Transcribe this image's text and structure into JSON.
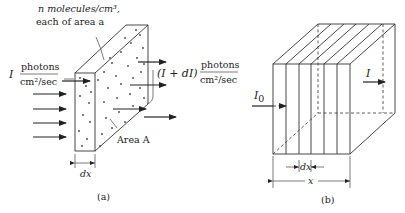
{
  "panel_a": {
    "annotation_line1": "n molecules/cm³,",
    "annotation_line2": "each of area a",
    "incident_symbol": "I",
    "incident_unit_num": "photons",
    "incident_unit_den": "cm²/sec",
    "exit_symbol": "(I + dI)",
    "exit_unit_num": "photons",
    "exit_unit_den": "cm²/sec",
    "area_label": "Area A",
    "thickness_label": "dx",
    "caption": "(a)"
  },
  "panel_b": {
    "incident_label": "I",
    "incident_subscript": "0",
    "exit_label": "I",
    "slice_label": "dx",
    "length_label": "x",
    "caption": "(b)"
  }
}
